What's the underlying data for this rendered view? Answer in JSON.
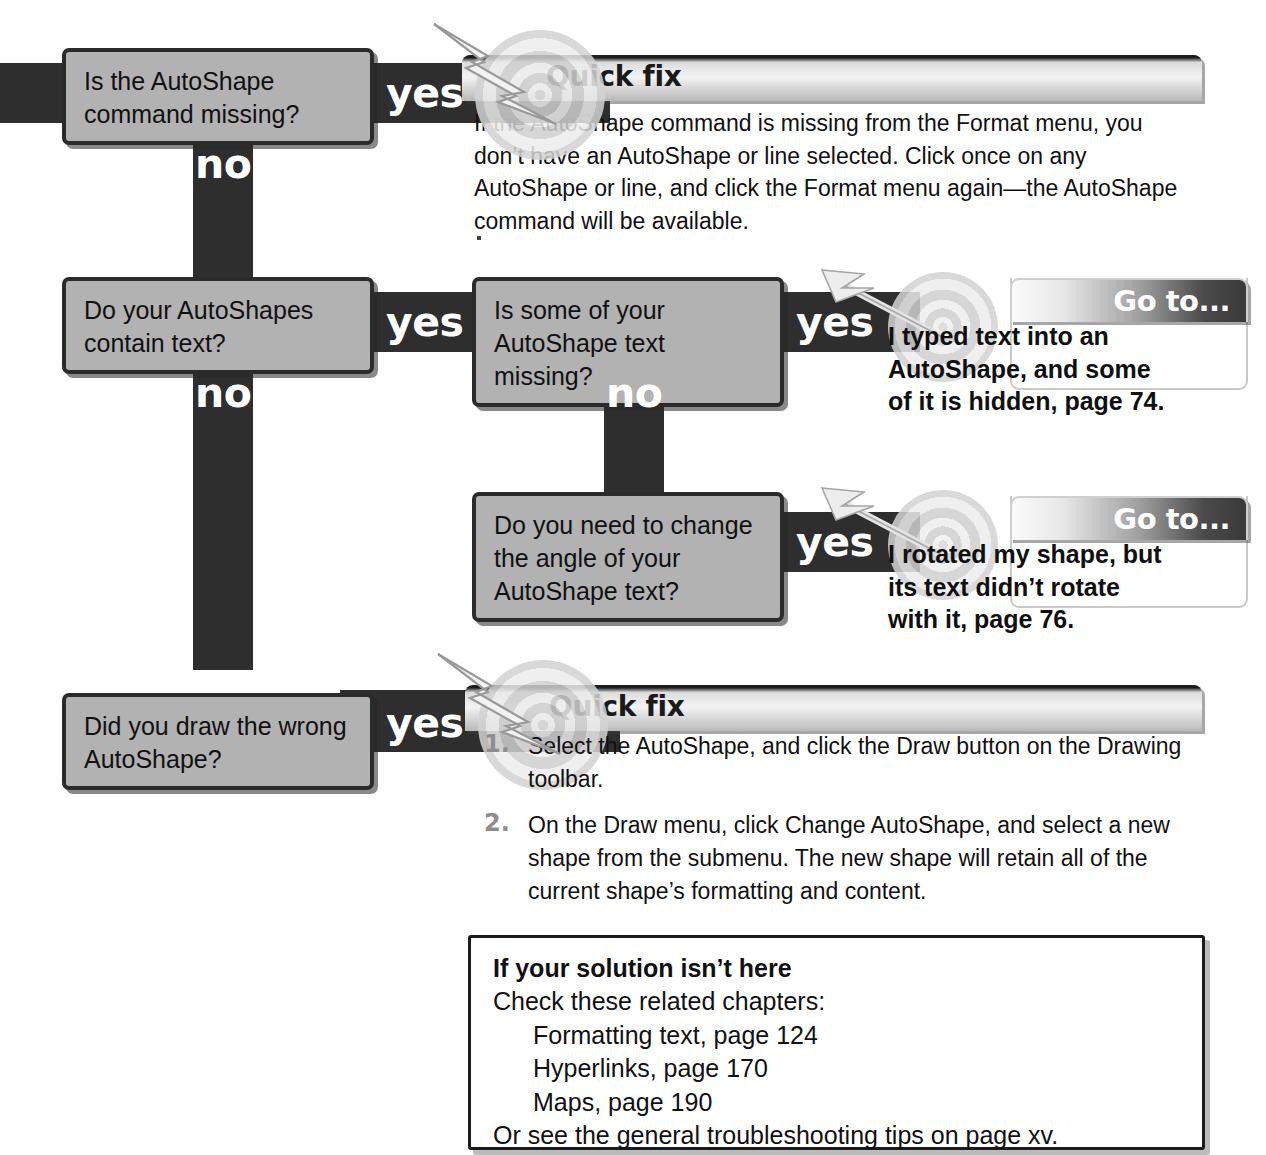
{
  "diagram": {
    "labels": {
      "yes": "yes",
      "no": "no"
    },
    "colors": {
      "connector": "#2e2e2e",
      "box_fill": "#b2b2b2",
      "box_border": "#2b2b2b",
      "page_background": "#ffffff",
      "label_text": "#ffffff",
      "step_number": "#8d8d8d"
    }
  },
  "questions": [
    {
      "id": "q1",
      "line1": "Is the AutoShape",
      "line2": "command missing?"
    },
    {
      "id": "q2",
      "line1": "Do your AutoShapes",
      "line2": "contain text?"
    },
    {
      "id": "q3",
      "line1": "Is some of your",
      "line2": "AutoShape text missing?"
    },
    {
      "id": "q4",
      "line1": "Do you need to change",
      "line2": "the angle of your",
      "line3": "AutoShape text?"
    },
    {
      "id": "q5",
      "line1": "Did you draw the wrong",
      "line2": "AutoShape?"
    }
  ],
  "panels": {
    "quickfix1": {
      "title": "Quick fix",
      "body": "If the AutoShape command is missing from the Format menu, you don’t have an AutoShape or line selected. Click once on any AutoShape or line, and click the Format menu again—the AutoShape command will be available."
    },
    "goto1": {
      "title": "Go to...",
      "line1": "I typed text into an",
      "line2": "AutoShape, and some",
      "line3": "of it is hidden, page 74."
    },
    "goto2": {
      "title": "Go to...",
      "line1": "I rotated my shape, but",
      "line2": "its text didn’t rotate",
      "line3": "with it, page 76."
    },
    "quickfix2": {
      "title": "Quick fix",
      "steps": [
        {
          "num": "1.",
          "text": "Select the AutoShape, and click the Draw button on the Drawing toolbar."
        },
        {
          "num": "2.",
          "text": "On the Draw menu, click Change AutoShape, and select a new shape from the submenu. The new shape will retain all of the current shape’s formatting and content."
        }
      ]
    }
  },
  "solution_box": {
    "heading": "If your solution isn’t here",
    "intro": "Check these related chapters:",
    "chapters": [
      "Formatting text, page 124",
      "Hyperlinks, page 170",
      "Maps, page 190"
    ],
    "footer": "Or see the general troubleshooting tips on page xv."
  }
}
